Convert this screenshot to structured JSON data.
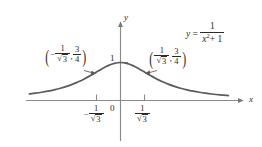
{
  "figure": {
    "background_color": "#ffffff",
    "curve_color": "#555555",
    "axis_color": "#808080",
    "text_color": "#2b2b2b"
  },
  "axes": {
    "x_axis_label": "x",
    "y_axis_label": "y",
    "origin_label": "0",
    "y_tick_label": "1",
    "x_ticks": [
      {
        "name": "negative-inv-sqrt3",
        "sign": "−",
        "numerator": "1",
        "denominator_radicand": "3"
      },
      {
        "name": "positive-inv-sqrt3",
        "sign": "",
        "numerator": "1",
        "denominator_radicand": "3"
      }
    ]
  },
  "equation": {
    "lhs": "y",
    "relation": "=",
    "numerator": "1",
    "denominator_base": "x",
    "denominator_exponent": "2",
    "denominator_tail": "+ 1",
    "plain_text": "y = 1 / (x² + 1)"
  },
  "annotations": [
    {
      "name": "inflection-point-left",
      "x_sign": "−",
      "x_numerator": "1",
      "x_denominator_radicand": "3",
      "y_numerator": "3",
      "y_denominator": "4",
      "plain_text": "(−1/√3, 3/4)"
    },
    {
      "name": "inflection-point-right",
      "x_sign": "",
      "x_numerator": "1",
      "x_denominator_radicand": "3",
      "y_numerator": "3",
      "y_denominator": "4",
      "plain_text": "(1/√3, 3/4)"
    }
  ],
  "chart_data": {
    "type": "line",
    "title": "",
    "subtitle": "",
    "xlabel": "x",
    "ylabel": "y",
    "equation": "y = 1/(x^2 + 1)",
    "grid": false,
    "legend": null,
    "xlim": [
      -2.2,
      2.7
    ],
    "ylim": [
      -0.12,
      1.45
    ],
    "x_tick_values": [
      -0.5774,
      0,
      0.5774
    ],
    "x_tick_labels": [
      "-1/√3",
      "0",
      "1/√3"
    ],
    "y_tick_values": [
      1
    ],
    "y_tick_labels": [
      "1"
    ],
    "series": [
      {
        "name": "y = 1/(x^2 + 1)",
        "x": [
          -2.2,
          -2.05,
          -1.9,
          -1.75,
          -1.6,
          -1.45,
          -1.3,
          -1.15,
          -1.0,
          -0.85,
          -0.7,
          -0.5774,
          -0.45,
          -0.3,
          -0.15,
          0.0,
          0.15,
          0.3,
          0.45,
          0.5774,
          0.7,
          0.85,
          1.0,
          1.15,
          1.3,
          1.45,
          1.6,
          1.75,
          1.9,
          2.05,
          2.2,
          2.4,
          2.6
        ],
        "y": [
          0.1712,
          0.1922,
          0.2169,
          0.2462,
          0.2809,
          0.3223,
          0.3717,
          0.4305,
          0.5,
          0.5805,
          0.6711,
          0.75,
          0.8316,
          0.9174,
          0.978,
          1.0,
          0.978,
          0.9174,
          0.8316,
          0.75,
          0.6711,
          0.5805,
          0.5,
          0.4305,
          0.3717,
          0.3223,
          0.2809,
          0.2462,
          0.2169,
          0.1922,
          0.1712,
          0.1479,
          0.1289
        ]
      }
    ],
    "annotated_points": [
      {
        "label": "(-1/√3, 3/4)",
        "x": -0.5774,
        "y": 0.75
      },
      {
        "label": "(1/√3, 3/4)",
        "x": 0.5774,
        "y": 0.75
      }
    ]
  }
}
